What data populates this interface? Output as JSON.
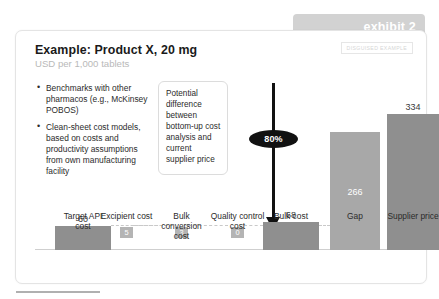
{
  "exhibit": {
    "tab_label": "exhibit 2"
  },
  "card": {
    "title": "Example: Product X, 20 mg",
    "subtitle": "USD per 1,000 tablets",
    "disguised_label": "DISGUISED EXAMPLE"
  },
  "bullets": [
    "Benchmarks with other pharmacos (e.g., McKinsey POBOS)",
    "Clean-sheet cost models, based on costs and productivity assumptions from own manufacturing facility"
  ],
  "callout": {
    "text": "Potential difference between bottom-up cost analysis and current supplier price"
  },
  "arrow": {
    "badge_label": "80%"
  },
  "colors": {
    "bar_dark": "#8f8f8f",
    "bar_light": "#a8a8a8",
    "chip": "#b4b4b4",
    "tab": "#d2d2d2",
    "arrow": "#111111",
    "subtitle": "#b9b9b9"
  },
  "chart_data": {
    "type": "bar",
    "title": "Example: Product X, 20 mg",
    "subtitle": "USD per 1,000 tablets",
    "xlabel": "",
    "ylabel": "USD per 1,000 tablets",
    "ylim": [
      0,
      334
    ],
    "grid": false,
    "legend": null,
    "categories": [
      "Target API cost",
      "Excipient cost",
      "Bulk conversion cost",
      "Quality control cost",
      "Bulk cost",
      "Gap",
      "Supplier price"
    ],
    "values": [
      60,
      5,
      3,
      0,
      68,
      266,
      334
    ],
    "value_labels": [
      "60",
      "5",
      "3",
      "0",
      "68",
      "266",
      "334"
    ],
    "label_placement": [
      "above",
      "chip",
      "chip",
      "chip",
      "above",
      "inside",
      "above"
    ],
    "annotations": [
      {
        "text": "80%",
        "type": "arrow-badge",
        "from": "Supplier price",
        "to": "Bulk cost"
      }
    ]
  }
}
